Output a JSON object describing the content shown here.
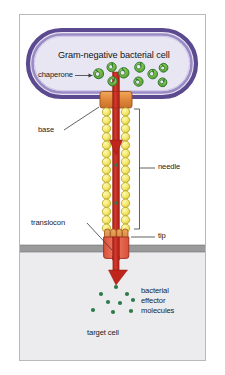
{
  "figure": {
    "title_in_cell": "Gram-negative bacterial cell",
    "target_cell_label": "target cell"
  },
  "labels": {
    "chaperone": "chaperone",
    "base": "base",
    "needle": "needle",
    "translocon": "translocon",
    "tip": "tip",
    "effector_line1": "bacterial",
    "effector_line2": "effector",
    "effector_line3": "molecules"
  },
  "colors": {
    "frame_border": "#b9b9bd",
    "page_background": "#ffffff",
    "cell_membrane_outer": "#5b4a8f",
    "cell_membrane_inner": "#8e7ec0",
    "cell_cytoplasm": "#e8e6f2",
    "chaperone_fill": "#7cbf4a",
    "chaperone_outline": "#2f7a2f",
    "base_fill": "#e08a3c",
    "base_outline": "#9a4f18",
    "needle_bead_fill": "#f5e96b",
    "needle_bead_outline": "#b8a32a",
    "secretion_channel": "#c0251c",
    "arrow_red": "#c0251c",
    "translocon_fill": "#e4614c",
    "translocon_outline": "#9a2d1c",
    "tip_fill": "#e0954a",
    "target_membrane": "#9a9a9a",
    "target_cytoplasm": "#ececee",
    "effector_dot": "#2f7a4a",
    "leader_line": "#3a3a3a",
    "text": "#1b1b1b"
  },
  "structure": {
    "bacterial_cell": {
      "shape": "rounded-capsule",
      "x": 28,
      "y": 30,
      "width": 168,
      "height": 67
    },
    "chaperones": [
      {
        "cx": 98,
        "cy": 74,
        "r": 5.0,
        "rot": -25
      },
      {
        "cx": 111,
        "cy": 67,
        "r": 4.6,
        "rot": 15
      },
      {
        "cx": 112,
        "cy": 81,
        "r": 4.6,
        "rot": 40
      },
      {
        "cx": 123,
        "cy": 73,
        "r": 5.2,
        "rot": -10
      },
      {
        "cx": 139,
        "cy": 67,
        "r": 5.0,
        "rot": 20
      },
      {
        "cx": 138,
        "cy": 82,
        "r": 4.6,
        "rot": -35
      },
      {
        "cx": 152,
        "cy": 74,
        "r": 4.8,
        "rot": 10
      },
      {
        "cx": 163,
        "cy": 68,
        "r": 4.4,
        "rot": -20
      },
      {
        "cx": 162,
        "cy": 82,
        "r": 4.4,
        "rot": 35
      }
    ],
    "base": {
      "x": 100,
      "y": 92,
      "width": 32,
      "height": 16
    },
    "needle": {
      "top": 109,
      "bottom": 224,
      "left_column_cx": 106.5,
      "right_column_cx": 125.5,
      "bead_r": 4.2,
      "bead_count": 14
    },
    "translocon": {
      "x": 104,
      "y": 229,
      "width": 24,
      "height": 26
    },
    "target_membrane": {
      "y": 245,
      "height": 7
    },
    "target_cell": {
      "y": 252,
      "height": 104
    },
    "effector_dots": [
      {
        "cx": 116,
        "cy": 287,
        "r": 2.1
      },
      {
        "cx": 101,
        "cy": 294,
        "r": 2.1
      },
      {
        "cx": 127,
        "cy": 294,
        "r": 2.1
      },
      {
        "cx": 108,
        "cy": 302,
        "r": 2.1
      },
      {
        "cx": 120,
        "cy": 303,
        "r": 2.1
      },
      {
        "cx": 133,
        "cy": 300,
        "r": 2.1
      },
      {
        "cx": 93,
        "cy": 310,
        "r": 2.1
      },
      {
        "cx": 113,
        "cy": 312,
        "r": 2.1
      },
      {
        "cx": 131,
        "cy": 311,
        "r": 2.1
      }
    ]
  }
}
